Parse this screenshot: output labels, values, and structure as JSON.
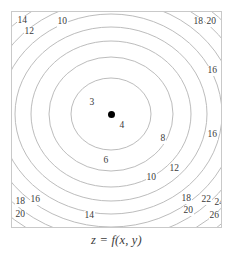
{
  "figure": {
    "caption": "z = f(x, y)",
    "frame_color": "#c9c9c9",
    "contour_color": "#b4b4b4",
    "label_color": "#3a3a3a",
    "background": "#ffffff",
    "peak_marker": "filled-dot"
  },
  "chart_data": {
    "type": "contour",
    "title": "",
    "subtitle": "",
    "xlabel": "",
    "ylabel": "",
    "zlabel": "z = f(x, y)",
    "grid": false,
    "legend": "none",
    "axis_ticks": false,
    "xlim": [
      0,
      211
    ],
    "ylim": [
      0,
      217
    ],
    "minimum": {
      "label": "3",
      "x_px": 100,
      "y_px": 103,
      "marker": "filled-dot"
    },
    "contour_interval": 2,
    "levels": [
      3,
      4,
      6,
      8,
      10,
      12,
      14,
      16,
      18,
      20,
      22,
      24,
      26
    ],
    "contours": [
      {
        "level": 4,
        "rx": 40,
        "ry": 36
      },
      {
        "level": 6,
        "rx": 62,
        "ry": 57
      },
      {
        "level": 8,
        "rx": 80,
        "ry": 73
      },
      {
        "level": 10,
        "rx": 96,
        "ry": 87
      },
      {
        "level": 12,
        "rx": 111,
        "ry": 100
      },
      {
        "level": 14,
        "rx": 125,
        "ry": 113
      },
      {
        "level": 16,
        "rx": 139,
        "ry": 125
      },
      {
        "level": 18,
        "rx": 152,
        "ry": 137
      },
      {
        "level": 20,
        "rx": 165,
        "ry": 148
      },
      {
        "level": 22,
        "rx": 177,
        "ry": 159
      },
      {
        "level": 24,
        "rx": 189,
        "ry": 170
      },
      {
        "level": 26,
        "rx": 201,
        "ry": 181
      }
    ],
    "labels": [
      {
        "text": "14",
        "x_px": 16,
        "y_px": 15,
        "level": 14
      },
      {
        "text": "10",
        "x_px": 56,
        "y_px": 16,
        "level": 10
      },
      {
        "text": "12",
        "x_px": 23,
        "y_px": 26,
        "level": 12
      },
      {
        "text": "18",
        "x_px": 192,
        "y_px": 16,
        "level": 18
      },
      {
        "text": "20",
        "x_px": 205,
        "y_px": 16,
        "level": 20
      },
      {
        "text": "16",
        "x_px": 206,
        "y_px": 65,
        "level": 16
      },
      {
        "text": "3",
        "x_px": 88,
        "y_px": 97,
        "level": 3
      },
      {
        "text": "4",
        "x_px": 118,
        "y_px": 120,
        "level": 4
      },
      {
        "text": "8",
        "x_px": 159,
        "y_px": 133,
        "level": 8
      },
      {
        "text": "16",
        "x_px": 206,
        "y_px": 129,
        "level": 16
      },
      {
        "text": "6",
        "x_px": 102,
        "y_px": 155,
        "level": 6
      },
      {
        "text": "12",
        "x_px": 168,
        "y_px": 163,
        "level": 12
      },
      {
        "text": "10",
        "x_px": 145,
        "y_px": 172,
        "level": 10
      },
      {
        "text": "18",
        "x_px": 180,
        "y_px": 193,
        "level": 18
      },
      {
        "text": "22",
        "x_px": 200,
        "y_px": 194,
        "level": 22
      },
      {
        "text": "24",
        "x_px": 213,
        "y_px": 197,
        "level": 24
      },
      {
        "text": "18",
        "x_px": 14,
        "y_px": 196,
        "level": 18
      },
      {
        "text": "16",
        "x_px": 29,
        "y_px": 194,
        "level": 16
      },
      {
        "text": "20",
        "x_px": 182,
        "y_px": 205,
        "level": 20
      },
      {
        "text": "26",
        "x_px": 208,
        "y_px": 210,
        "level": 26
      },
      {
        "text": "20",
        "x_px": 14,
        "y_px": 209,
        "level": 20
      },
      {
        "text": "14",
        "x_px": 83,
        "y_px": 210,
        "level": 14
      }
    ]
  }
}
